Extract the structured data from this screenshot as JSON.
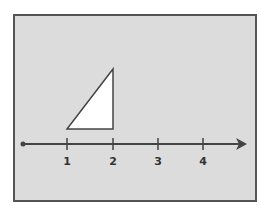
{
  "diagram": {
    "background": "#dcdcdc",
    "frame_color": "#555555",
    "line_color": "#444444",
    "triangle_fill": "#ffffff",
    "number_line": {
      "ticks": [
        {
          "label": "1",
          "x": 67
        },
        {
          "label": "2",
          "x": 113
        },
        {
          "label": "3",
          "x": 158
        },
        {
          "label": "4",
          "x": 203
        }
      ]
    },
    "triangle": {
      "vertices": [
        [
          67,
          129
        ],
        [
          113,
          129
        ],
        [
          113,
          69
        ]
      ],
      "description": "Right triangle with base from 1 to 2 on the number line"
    }
  }
}
